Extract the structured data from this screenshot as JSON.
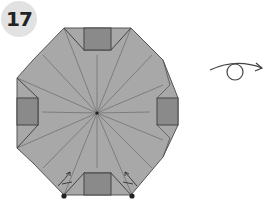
{
  "diagram": {
    "type": "origami-step",
    "step_number": "17",
    "colors": {
      "paper": "#a8a8a8",
      "flap": "#8a8a8a",
      "line": "#555555",
      "badge": "#e2e2e2",
      "badge_text": "#222222",
      "background": "#ffffff"
    },
    "elements": {
      "model": "octagonal-base-with-four-square-flaps",
      "crease_lines": 16,
      "squares": [
        "top",
        "left",
        "right",
        "bottom"
      ],
      "fold_arrows": [
        "bottom-left",
        "bottom-right"
      ],
      "pivot_dots": [
        "bottom-left",
        "bottom-right"
      ],
      "symbol": "turn-over"
    }
  }
}
